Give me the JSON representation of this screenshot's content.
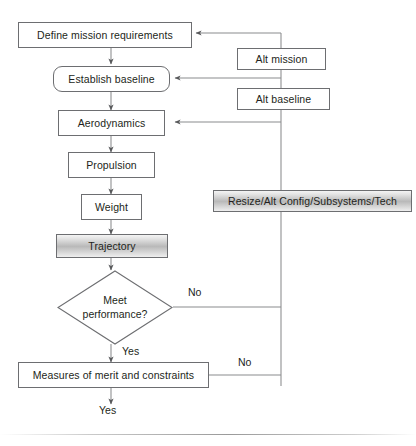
{
  "diagram": {
    "nodes": {
      "define_mission": {
        "label": "Define mission requirements",
        "shape": "rectangle"
      },
      "establish_baseline": {
        "label": "Establish baseline",
        "shape": "rounded-rectangle"
      },
      "aerodynamics": {
        "label": "Aerodynamics",
        "shape": "rectangle"
      },
      "propulsion": {
        "label": "Propulsion",
        "shape": "rectangle"
      },
      "weight": {
        "label": "Weight",
        "shape": "rectangle"
      },
      "trajectory": {
        "label": "Trajectory",
        "shape": "gradient-rectangle"
      },
      "meet_performance": {
        "label_line1": "Meet",
        "label_line2": "performance?",
        "shape": "diamond"
      },
      "measures": {
        "label": "Measures of merit and constraints",
        "shape": "rectangle"
      },
      "alt_mission": {
        "label": "Alt mission",
        "shape": "rectangle"
      },
      "alt_baseline": {
        "label": "Alt baseline",
        "shape": "rectangle"
      },
      "resize": {
        "label": "Resize/Alt Config/Subsystems/Tech",
        "shape": "gradient-rectangle"
      }
    },
    "edge_labels": {
      "decision_no": "No",
      "decision_yes": "Yes",
      "measures_no": "No",
      "measures_yes": "Yes"
    },
    "colors": {
      "stroke": "#6d6e71",
      "text": "#231f20",
      "background": "#ffffff",
      "gradient_light": "#f4f4f4",
      "gradient_dark": "#b9b9b9"
    }
  }
}
